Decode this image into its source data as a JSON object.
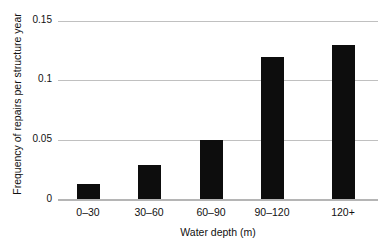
{
  "chart_data": {
    "type": "bar",
    "title": "",
    "subtitle": "",
    "xlabel": "Water depth (m)",
    "ylabel": "Frequency of repairs per structure year",
    "categories": [
      "0–30",
      "30–60",
      "60–90",
      "90–120",
      "120+"
    ],
    "values": [
      0.013,
      0.029,
      0.05,
      0.12,
      0.13
    ],
    "series": [
      {
        "name": "Frequency of repairs per structure year",
        "values": [
          0.013,
          0.029,
          0.05,
          0.12,
          0.13
        ]
      }
    ],
    "ylim": [
      0,
      0.15
    ],
    "yticks": [
      0,
      0.05,
      0.1,
      0.15
    ],
    "ytick_labels": [
      "0",
      "0.05",
      "0.1",
      "0.15"
    ],
    "grid": "horizontal",
    "legend": "none",
    "bar_color": "#0d0d0d",
    "grid_color": "#c0c0c0",
    "axis_color": "#b5b5b5",
    "annotations": []
  },
  "axes": {
    "y_title": "Frequency of repairs per structure year",
    "x_title": "Water depth (m)",
    "y_tick_0": "0",
    "y_tick_1": "0.05",
    "y_tick_2": "0.1",
    "y_tick_3": "0.15",
    "x_tick_0": "0–30",
    "x_tick_1": "30–60",
    "x_tick_2": "60–90",
    "x_tick_3": "90–120",
    "x_tick_4": "120+"
  }
}
